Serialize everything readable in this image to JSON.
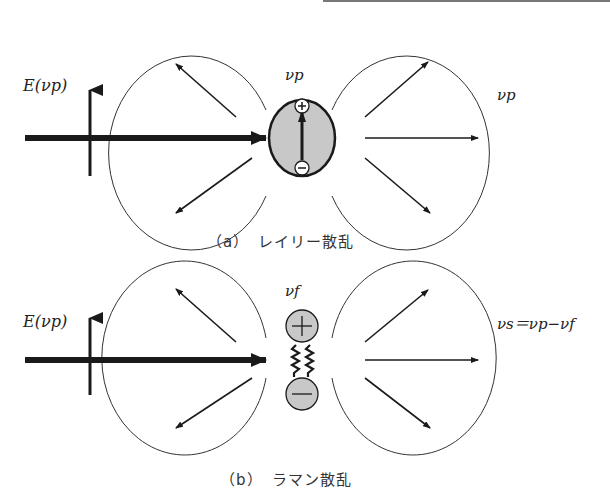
{
  "panels": [
    {
      "id": "a",
      "field_label": "E(νp)",
      "center_label": "νp",
      "scattered_label": "νp",
      "caption": "（a）　レイリー散乱",
      "particle": "dipole",
      "plus_symbol": "+",
      "minus_symbol": "−"
    },
    {
      "id": "b",
      "field_label": "E(νp)",
      "center_label": "νf",
      "scattered_label": "νs＝νp−νf",
      "caption": "（b）　ラマン散乱",
      "particle": "spring-coupled charges",
      "plus_symbol": "+",
      "minus_symbol": "−"
    }
  ],
  "colors": {
    "line": "#1a1a1a",
    "particle_fill": "#c8c8c8",
    "header_rule": "#777777"
  }
}
